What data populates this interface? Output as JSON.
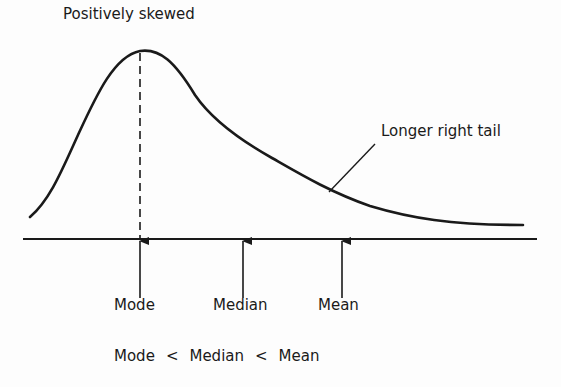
{
  "diagram": {
    "title": "Positively skewed",
    "tail_annotation": "Longer right tail",
    "markers": [
      {
        "label": "Mode",
        "x": 140
      },
      {
        "label": "Median",
        "x": 243
      },
      {
        "label": "Mean",
        "x": 342
      }
    ],
    "relation": {
      "left": "Mode",
      "op1": "<",
      "middle": "Median",
      "op2": "<",
      "right": "Mean"
    },
    "colors": {
      "ink": "#1a1a1a",
      "background": "#fdfdfd"
    }
  }
}
